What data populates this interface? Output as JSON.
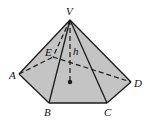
{
  "figure": {
    "type": "pentagonal pyramid",
    "colors": {
      "fill": "#c4c4c4",
      "stroke": "#1a1a1a",
      "background": "#ffffff"
    },
    "vertices": {
      "V": {
        "label": "V",
        "x": 70,
        "y": 20
      },
      "A": {
        "label": "A",
        "x": 19,
        "y": 74
      },
      "B": {
        "label": "B",
        "x": 49,
        "y": 103
      },
      "C": {
        "label": "C",
        "x": 107,
        "y": 103
      },
      "D": {
        "label": "D",
        "x": 131,
        "y": 82
      },
      "E": {
        "label": "E",
        "x": 53,
        "y": 57
      }
    },
    "height_label": "h",
    "base_center": {
      "x": 70,
      "y": 82
    }
  }
}
